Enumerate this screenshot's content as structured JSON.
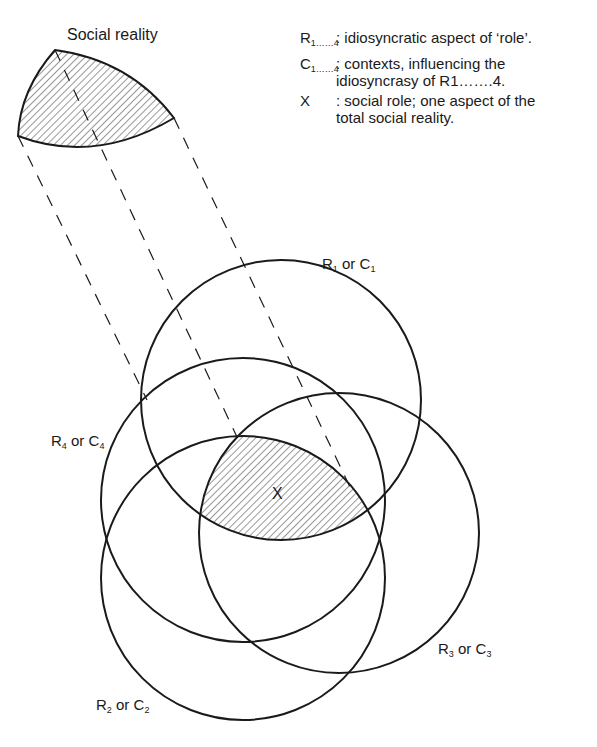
{
  "title": "Social reality",
  "legend": [
    {
      "key": "R",
      "sub": "1……4",
      "desc": ": idiosyncratic aspect of ‘role’."
    },
    {
      "key": "C",
      "sub": "1……4",
      "desc": ": contexts,   influencing the idiosyncrasy of R1…….4."
    },
    {
      "key": "X",
      "sub": "",
      "desc": ": social role; one aspect of the total social reality."
    }
  ],
  "circles": [
    {
      "id": "R1",
      "label_main": "R",
      "label_sub1": "1",
      "label_mid": " or C",
      "label_sub2": "1",
      "cx": 281,
      "cy": 400,
      "r": 140
    },
    {
      "id": "R2",
      "label_main": "R",
      "label_sub1": "2",
      "label_mid": " or C",
      "label_sub2": "2",
      "cx": 243,
      "cy": 578,
      "r": 142
    },
    {
      "id": "R3",
      "label_main": "R",
      "label_sub1": "3",
      "label_mid": " or C",
      "label_sub2": "3",
      "cx": 339,
      "cy": 533,
      "r": 140
    },
    {
      "id": "R4",
      "label_main": "R",
      "label_sub1": "4",
      "label_mid": " or C",
      "label_sub2": "4",
      "cx": 243,
      "cy": 500,
      "r": 142
    }
  ],
  "center_label": "X",
  "colors": {
    "ink": "#1a1a1a",
    "background": "#ffffff"
  }
}
